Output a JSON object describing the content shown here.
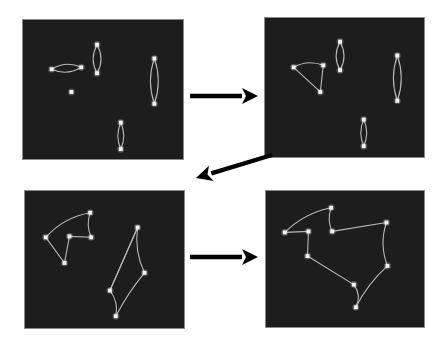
{
  "figure": {
    "background_color": "#ffffff",
    "panel_background_color": "#1d1d1d",
    "panel_border_color": "#8a8a8a",
    "node_color": "#f2f2f2",
    "edge_color": "#b9b9b9",
    "arrow_color": "#000000",
    "panel_count": 4,
    "arrow_count": 3
  },
  "panels": [
    {
      "id": "panel-top-left",
      "label": "Step 1",
      "x": 22,
      "y": 19,
      "w": 162,
      "h": 141,
      "node_count": 9,
      "edge_count": 8,
      "nodes": [
        {
          "id": "n0",
          "x": 29,
          "y": 50
        },
        {
          "id": "n1",
          "x": 59,
          "y": 48
        },
        {
          "id": "n2",
          "x": 49,
          "y": 73
        },
        {
          "id": "n3",
          "x": 75,
          "y": 25
        },
        {
          "id": "n4",
          "x": 75,
          "y": 54
        },
        {
          "id": "n5",
          "x": 133,
          "y": 39
        },
        {
          "id": "n6",
          "x": 133,
          "y": 85
        },
        {
          "id": "n7",
          "x": 99,
          "y": 104
        },
        {
          "id": "n8",
          "x": 99,
          "y": 131
        }
      ],
      "edges": [
        {
          "from": "n0",
          "to": "n1",
          "curve": -8
        },
        {
          "from": "n1",
          "to": "n0",
          "curve": -8
        },
        {
          "from": "n3",
          "to": "n4",
          "curve": -8
        },
        {
          "from": "n4",
          "to": "n3",
          "curve": -8
        },
        {
          "from": "n5",
          "to": "n6",
          "curve": -8
        },
        {
          "from": "n6",
          "to": "n5",
          "curve": -8
        },
        {
          "from": "n7",
          "to": "n8",
          "curve": -6
        },
        {
          "from": "n8",
          "to": "n7",
          "curve": -6
        }
      ]
    },
    {
      "id": "panel-top-right",
      "label": "Step 2",
      "x": 264,
      "y": 17,
      "w": 161,
      "h": 141,
      "node_count": 9,
      "edge_count": 9,
      "nodes": [
        {
          "id": "n0",
          "x": 29,
          "y": 50
        },
        {
          "id": "n1",
          "x": 59,
          "y": 48
        },
        {
          "id": "n2",
          "x": 56,
          "y": 75
        },
        {
          "id": "n3",
          "x": 76,
          "y": 24
        },
        {
          "id": "n4",
          "x": 76,
          "y": 53
        },
        {
          "id": "n5",
          "x": 134,
          "y": 38
        },
        {
          "id": "n6",
          "x": 134,
          "y": 84
        },
        {
          "id": "n7",
          "x": 100,
          "y": 103
        },
        {
          "id": "n8",
          "x": 100,
          "y": 130
        }
      ],
      "edges": [
        {
          "from": "n0",
          "to": "n1",
          "curve": -7
        },
        {
          "from": "n1",
          "to": "n2",
          "curve": 0
        },
        {
          "from": "n2",
          "to": "n0",
          "curve": 0
        },
        {
          "from": "n3",
          "to": "n4",
          "curve": -8
        },
        {
          "from": "n4",
          "to": "n3",
          "curve": -8
        },
        {
          "from": "n5",
          "to": "n6",
          "curve": -8
        },
        {
          "from": "n6",
          "to": "n5",
          "curve": -8
        },
        {
          "from": "n7",
          "to": "n8",
          "curve": -6
        },
        {
          "from": "n8",
          "to": "n7",
          "curve": -6
        }
      ]
    },
    {
      "id": "panel-bottom-left",
      "label": "Step 3",
      "x": 24,
      "y": 190,
      "w": 161,
      "h": 139,
      "node_count": 9,
      "edge_count": 10,
      "nodes": [
        {
          "id": "n0",
          "x": 21,
          "y": 47
        },
        {
          "id": "n1",
          "x": 45,
          "y": 46
        },
        {
          "id": "n2",
          "x": 40,
          "y": 73
        },
        {
          "id": "n3",
          "x": 66,
          "y": 22
        },
        {
          "id": "n4",
          "x": 67,
          "y": 47
        },
        {
          "id": "n5",
          "x": 114,
          "y": 37
        },
        {
          "id": "n6",
          "x": 121,
          "y": 83
        },
        {
          "id": "n7",
          "x": 86,
          "y": 101
        },
        {
          "id": "n8",
          "x": 92,
          "y": 127
        }
      ],
      "edges": [
        {
          "from": "n0",
          "to": "n3",
          "curve": -9
        },
        {
          "from": "n3",
          "to": "n4",
          "curve": 5
        },
        {
          "from": "n4",
          "to": "n1",
          "curve": 0
        },
        {
          "from": "n1",
          "to": "n2",
          "curve": 0
        },
        {
          "from": "n2",
          "to": "n0",
          "curve": 0
        },
        {
          "from": "n5",
          "to": "n6",
          "curve": 7
        },
        {
          "from": "n6",
          "to": "n8",
          "curve": 3
        },
        {
          "from": "n8",
          "to": "n7",
          "curve": 6
        },
        {
          "from": "n7",
          "to": "n5",
          "curve": 0
        },
        {
          "from": "n7",
          "to": "n5",
          "curve": 0
        }
      ]
    },
    {
      "id": "panel-bottom-right",
      "label": "Step 4",
      "x": 265,
      "y": 190,
      "w": 160,
      "h": 138,
      "node_count": 9,
      "edge_count": 9,
      "nodes": [
        {
          "id": "n0",
          "x": 19,
          "y": 42
        },
        {
          "id": "n1",
          "x": 43,
          "y": 41
        },
        {
          "id": "n2",
          "x": 42,
          "y": 66
        },
        {
          "id": "n3",
          "x": 66,
          "y": 17
        },
        {
          "id": "n4",
          "x": 67,
          "y": 41
        },
        {
          "id": "n5",
          "x": 122,
          "y": 32
        },
        {
          "id": "n6",
          "x": 123,
          "y": 76
        },
        {
          "id": "n7",
          "x": 89,
          "y": 95
        },
        {
          "id": "n8",
          "x": 91,
          "y": 118
        }
      ],
      "edges": [
        {
          "from": "n0",
          "to": "n3",
          "curve": -8
        },
        {
          "from": "n3",
          "to": "n4",
          "curve": 5
        },
        {
          "from": "n4",
          "to": "n5",
          "curve": 0
        },
        {
          "from": "n5",
          "to": "n6",
          "curve": 8
        },
        {
          "from": "n6",
          "to": "n8",
          "curve": 5
        },
        {
          "from": "n8",
          "to": "n7",
          "curve": 7
        },
        {
          "from": "n7",
          "to": "n2",
          "curve": 0
        },
        {
          "from": "n2",
          "to": "n1",
          "curve": 0
        },
        {
          "from": "n1",
          "to": "n0",
          "curve": 0
        }
      ]
    }
  ],
  "arrows": [
    {
      "id": "arrow-1",
      "label": "top-left to top-right",
      "direction": "right",
      "x1": 190,
      "y1": 96,
      "x2": 258,
      "y2": 96
    },
    {
      "id": "arrow-2",
      "label": "top-right to bottom-left",
      "direction": "down-left",
      "x1": 272,
      "y1": 155,
      "x2": 196,
      "y2": 178
    },
    {
      "id": "arrow-3",
      "label": "bottom-left to bottom-right",
      "direction": "right",
      "x1": 190,
      "y1": 257,
      "x2": 258,
      "y2": 257
    }
  ]
}
